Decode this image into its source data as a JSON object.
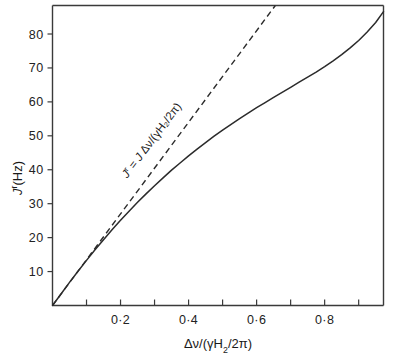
{
  "figure": {
    "background_color": "#ffffff",
    "line_color": "#2b2b2b",
    "axis_color": "#3a3a3a"
  },
  "chart_data": {
    "type": "line",
    "title": "",
    "subtitle": "",
    "xlabel": "Δν/(γH₂/2π)",
    "ylabel": "ᵊʳ(Hz)",
    "ylabel_parts": {
      "symbol": "J",
      "superscript": "r",
      "units": "(Hz)"
    },
    "xlabel_parts": {
      "numerator": "Δν",
      "slash": "/",
      "denominator_open": "(",
      "gamma": "γ",
      "field": "H",
      "field_sub": "2",
      "over": "/2",
      "pi": "π",
      "denominator_close": ")"
    },
    "xlim": [
      0,
      0.973
    ],
    "ylim": [
      0,
      88.4
    ],
    "grid": false,
    "legend": "none",
    "x_ticks_all": [
      0.1,
      0.2,
      0.3,
      0.4,
      0.5,
      0.6,
      0.7,
      0.8,
      0.9
    ],
    "x_tick_labels": [
      {
        "value": 0.2,
        "text": "0·2"
      },
      {
        "value": 0.4,
        "text": "0·4"
      },
      {
        "value": 0.6,
        "text": "0·6"
      },
      {
        "value": 0.8,
        "text": "0·8"
      }
    ],
    "y_ticks_all": [
      10,
      20,
      30,
      40,
      50,
      60,
      70,
      80
    ],
    "y_tick_labels": [
      {
        "value": 10,
        "text": "10"
      },
      {
        "value": 20,
        "text": "20"
      },
      {
        "value": 30,
        "text": "30"
      },
      {
        "value": 40,
        "text": "40"
      },
      {
        "value": 50,
        "text": "50"
      },
      {
        "value": 60,
        "text": "60"
      },
      {
        "value": 70,
        "text": "70"
      },
      {
        "value": 80,
        "text": "80"
      }
    ],
    "series": [
      {
        "name": "observed-reduced-coupling",
        "style": "solid",
        "x": [
          0.0,
          0.025,
          0.05,
          0.075,
          0.1,
          0.125,
          0.15,
          0.175,
          0.2,
          0.225,
          0.25,
          0.275,
          0.3,
          0.325,
          0.35,
          0.375,
          0.4,
          0.425,
          0.45,
          0.475,
          0.5,
          0.525,
          0.55,
          0.575,
          0.6,
          0.625,
          0.65,
          0.675,
          0.7,
          0.725,
          0.75,
          0.775,
          0.8,
          0.825,
          0.85,
          0.875,
          0.9,
          0.925,
          0.95,
          0.973
        ],
        "y": [
          0.0,
          3.4,
          6.8,
          10.1,
          13.3,
          16.4,
          19.4,
          22.3,
          25.1,
          27.8,
          30.4,
          32.9,
          35.3,
          37.6,
          39.9,
          42.0,
          44.1,
          46.1,
          48.0,
          49.9,
          51.7,
          53.4,
          55.1,
          56.7,
          58.3,
          59.8,
          61.3,
          62.8,
          64.3,
          65.8,
          67.3,
          68.8,
          70.4,
          72.1,
          73.9,
          75.9,
          78.1,
          80.6,
          83.4,
          86.6
        ]
      },
      {
        "name": "linear-asymptote",
        "style": "dashed",
        "x": [
          0.0,
          0.655
        ],
        "y": [
          0.0,
          88.4
        ]
      }
    ],
    "annotations": [
      {
        "name": "linear-relation-formula",
        "text": "ᵊʳ = ᵊ Δν/(γH₂/2π)",
        "text_parts": {
          "jr_symbol": "J",
          "jr_sup": "r",
          "equals": "=",
          "j_symbol": "J",
          "expr": "Δν/(γH₂/2π)"
        },
        "x": 0.3,
        "y": 48,
        "rotation_deg": -53
      }
    ]
  }
}
